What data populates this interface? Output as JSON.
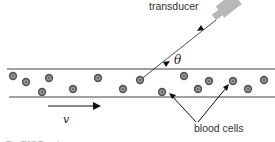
{
  "figure": {
    "caption": "Fig. B17 Doppler scan",
    "labels": {
      "transducer": "transducer",
      "angle": "θ",
      "velocity": "v",
      "blood_cells": "blood cells"
    },
    "colors": {
      "line": "#333333",
      "transducer": "#b8b8b8",
      "cell_outer": "#555555",
      "cell_inner": "#9a9a9a",
      "caption": "#999999"
    },
    "vessel": {
      "top_y": 69,
      "bottom_y": 97
    },
    "cells": [
      {
        "x": 13,
        "y": 76
      },
      {
        "x": 26,
        "y": 82
      },
      {
        "x": 49,
        "y": 78
      },
      {
        "x": 42,
        "y": 92
      },
      {
        "x": 73,
        "y": 89
      },
      {
        "x": 98,
        "y": 78
      },
      {
        "x": 123,
        "y": 89
      },
      {
        "x": 140,
        "y": 80
      },
      {
        "x": 162,
        "y": 92
      },
      {
        "x": 184,
        "y": 76
      },
      {
        "x": 198,
        "y": 89
      },
      {
        "x": 209,
        "y": 81
      },
      {
        "x": 233,
        "y": 81
      },
      {
        "x": 248,
        "y": 89
      },
      {
        "x": 264,
        "y": 80
      }
    ]
  }
}
